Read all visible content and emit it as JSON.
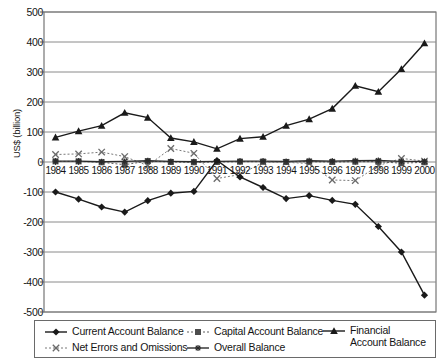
{
  "chart_data": {
    "type": "line",
    "title": "",
    "xlabel": "",
    "ylabel": "US$ (billion)",
    "ylim": [
      -500,
      500
    ],
    "ytick_values": [
      500,
      400,
      300,
      200,
      100,
      0,
      -100,
      -200,
      -300,
      -400,
      -500
    ],
    "ytick_labels": [
      "500",
      "400",
      "300",
      "200",
      "100",
      "0",
      "-100",
      "-200",
      "-300",
      "-400",
      "-500"
    ],
    "grid": "horizontal",
    "legend_position": "bottom",
    "categories": [
      "1984",
      "1985",
      "1986",
      "1987",
      "1988",
      "1989",
      "1990",
      "1991",
      "1992",
      "1993",
      "1994",
      "1995",
      "1996",
      "1997",
      "1998",
      "1999",
      "2000"
    ],
    "series": [
      {
        "name": "Current Account Balance",
        "marker": "diamond",
        "line": "solid",
        "color": "#1a1a1a",
        "values": [
          -100,
          -124,
          -150,
          -167,
          -129,
          -104,
          -98,
          5,
          -50,
          -85,
          -122,
          -112,
          -128,
          -141,
          -215,
          -300,
          -444
        ]
      },
      {
        "name": "Capital Account Balance",
        "marker": "square",
        "line": "dotted",
        "color": "#4d4d4d",
        "values": [
          2,
          2,
          -1,
          -9,
          3,
          0,
          -1,
          0,
          1,
          1,
          0,
          1,
          0,
          1,
          1,
          -4,
          -1
        ]
      },
      {
        "name": "Financial Account Balance",
        "marker": "triangle",
        "line": "solid",
        "color": "#1a1a1a",
        "values": [
          82,
          103,
          121,
          164,
          148,
          80,
          67,
          44,
          78,
          84,
          121,
          143,
          178,
          254,
          234,
          310,
          396
        ]
      },
      {
        "name": "Net Errors and Omissions",
        "marker": "x",
        "line": "dotted",
        "color": "#6a6a6a",
        "values": [
          25,
          27,
          33,
          18,
          -12,
          45,
          29,
          -55,
          -42,
          -1,
          -1,
          -5,
          -60,
          -62,
          -12,
          12,
          3
        ]
      },
      {
        "name": "Overall Balance",
        "marker": "star",
        "line": "solid",
        "color": "#2b2b2b",
        "values": [
          3,
          3,
          1,
          2,
          4,
          2,
          1,
          2,
          3,
          3,
          2,
          4,
          3,
          4,
          5,
          2,
          2
        ]
      }
    ],
    "legend_entries": [
      {
        "label": "Current Account Balance",
        "marker": "diamond",
        "line": "solid"
      },
      {
        "label": "Capital Account Balance",
        "marker": "square",
        "line": "dotted"
      },
      {
        "label": "Financial Account Balance",
        "marker": "triangle",
        "line": "solid"
      },
      {
        "label": "Net Errors and Omissions",
        "marker": "x",
        "line": "dotted"
      },
      {
        "label": "Overall Balance",
        "marker": "star",
        "line": "solid"
      }
    ]
  },
  "colors": {
    "plot_border": "#5a5a5a",
    "gridline": "#8a8a8a",
    "axis_text": "#141414",
    "series_dark": "#1a1a1a",
    "series_mid": "#4d4d4d",
    "series_light": "#6a6a6a"
  }
}
